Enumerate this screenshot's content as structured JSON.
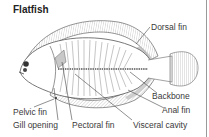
{
  "diagram": {
    "title": "Flatfish",
    "labels": {
      "dorsal_fin": "Dorsal fin",
      "backbone": "Backbone",
      "anal_fin": "Anal fin",
      "visceral_cavity": "Visceral cavity",
      "pectoral_fin": "Pectoral fin",
      "gill_opening": "Gill opening",
      "pelvic_fin": "Pelvic fin"
    },
    "colors": {
      "line": "#555555",
      "hatch": "#8a8a8a",
      "fin_shade": "#bdbdbd",
      "background": "#ffffff"
    }
  }
}
